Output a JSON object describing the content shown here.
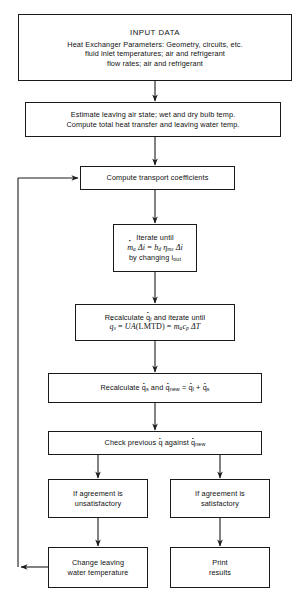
{
  "diagram": {
    "stroke_color": "#1a1a1a",
    "background_color": "#ffffff"
  },
  "nodes": {
    "input_data": {
      "heading": "INPUT DATA",
      "line1": "Heat Exchanger Parameters:  Geometry, circuits, etc.",
      "line2": "fluid inlet temperatures; air and refrigerant",
      "line3": "flow rates; air and refrigerant"
    },
    "estimate": {
      "line1": "Estimate leaving air state; wet and dry bulb temp.",
      "line2": "Compute total heat transfer and leaving water temp."
    },
    "transport": {
      "line1": "Compute transport coefficients"
    },
    "iterate": {
      "line1": "Iterate until",
      "equation_lhs_m": "m",
      "equation_lhs_m_sub": "a",
      "equation_delta_i": "Δi",
      "equation_equals": "=",
      "equation_b": "b",
      "equation_b_sub": "d",
      "equation_eta": "η",
      "equation_eta_sub": "ms",
      "line3_pre": "by changing ",
      "line3_i": "i",
      "line3_i_sub": "out"
    },
    "recalc_ql": {
      "line1_pre": "Recalculate ",
      "line1_q": "q",
      "line1_q_sub": "l",
      "line1_post": " and iterate until",
      "line2_q": "q",
      "line2_q_sub": "s",
      "line2_ua": "UA",
      "line2_lmtd": "(LMTD)",
      "line2_m": "m",
      "line2_m_sub": "a",
      "line2_c": "c",
      "line2_c_sub": "p",
      "line2_dt": "ΔT"
    },
    "recalc_qs": {
      "pre": "Recalculate ",
      "q1": "q",
      "q1_sub": "s",
      "mid": " and ",
      "q2": "q",
      "q2_sub": "new",
      "eq": "=",
      "q3": "q",
      "q3_sub": "l",
      "plus": "+",
      "q4": "q",
      "q4_sub": "s"
    },
    "check": {
      "pre": "Check previous ",
      "q1": "q",
      "mid": " against ",
      "q2": "q",
      "q2_sub": "new"
    },
    "unsatisfactory": {
      "line1": "If agreement is",
      "line2": "unsatisfactory"
    },
    "satisfactory": {
      "line1": "If agreement is",
      "line2": "satisfactory"
    },
    "change_water": {
      "line1": "Change leaving",
      "line2": "water temperature"
    },
    "print_results": {
      "line1": "Print",
      "line2": "results"
    }
  }
}
